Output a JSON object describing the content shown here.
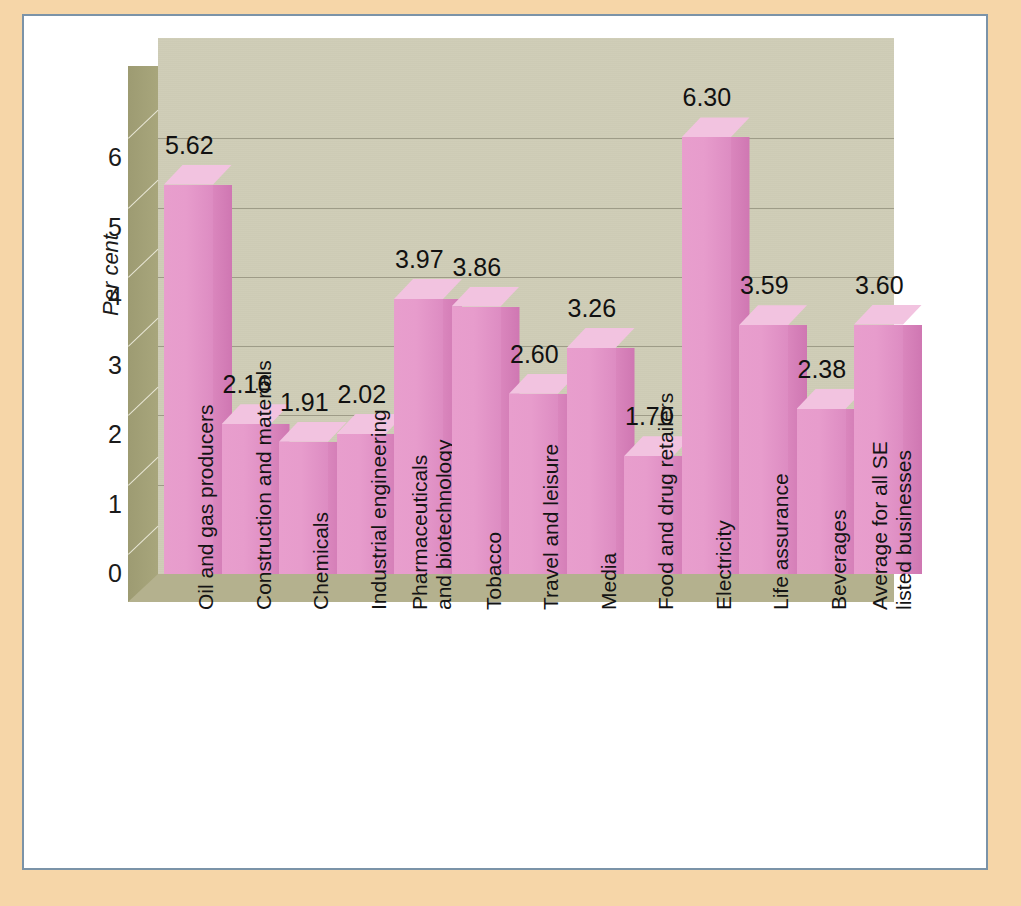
{
  "chart_data": {
    "type": "bar",
    "title": "",
    "subtitle": "",
    "xlabel": "",
    "ylabel": "Per cent",
    "ylim": [
      0,
      6.8
    ],
    "yticks": [
      "0",
      "1",
      "2",
      "3",
      "4",
      "5",
      "6"
    ],
    "grid": true,
    "legend": false,
    "style": "3d-column",
    "bar_color": "#e79ccc",
    "bar_top_color": "#f2c3e0",
    "bar_side_color": "#d47eb8",
    "plot_bg_color": "#cfcdb7",
    "wall_side_color": "#a2a077",
    "floor_color": "#b4b18e",
    "categories": [
      "Oil and gas producers",
      "Construction and materials",
      "Chemicals",
      "Industrial engineering",
      "Pharmaceuticals and biotechnology",
      "Tobacco",
      "Travel and leisure",
      "Media",
      "Food and drug retailers",
      "Electricity",
      "Life assurance",
      "Beverages",
      "Average for all SE listed businesses"
    ],
    "category_lines": [
      [
        "Oil and gas producers"
      ],
      [
        "Construction and materials"
      ],
      [
        "Chemicals"
      ],
      [
        "Industrial engineering"
      ],
      [
        "Pharmaceuticals",
        "and biotechnology"
      ],
      [
        "Tobacco"
      ],
      [
        "Travel and leisure"
      ],
      [
        "Media"
      ],
      [
        "Food and drug retailers"
      ],
      [
        "Electricity"
      ],
      [
        "Life assurance"
      ],
      [
        "Beverages"
      ],
      [
        "Average for all SE",
        "listed businesses"
      ]
    ],
    "values": [
      5.62,
      2.16,
      1.91,
      2.02,
      3.97,
      3.86,
      2.6,
      3.26,
      1.7,
      6.3,
      3.59,
      2.38,
      3.6
    ],
    "value_labels": [
      "5.62",
      "2.16",
      "1.91",
      "2.02",
      "3.97",
      "3.86",
      "2.60",
      "3.26",
      "1.70",
      "6.30",
      "3.59",
      "2.38",
      "3.60"
    ]
  },
  "frame": {
    "outer_bg": "#f6d6a8",
    "card_bg": "#ffffff",
    "border_color": "#7b93a8"
  }
}
